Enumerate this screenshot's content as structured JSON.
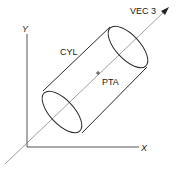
{
  "diagram": {
    "axes": {
      "x_label": "X",
      "y_label": "Y"
    },
    "cylinder_label": "CYL",
    "point_label": "PTA",
    "vector_label": "VEC 3",
    "colors": {
      "ink": "#2a2a2a",
      "thin": "#666666",
      "background": "#ffffff"
    }
  }
}
